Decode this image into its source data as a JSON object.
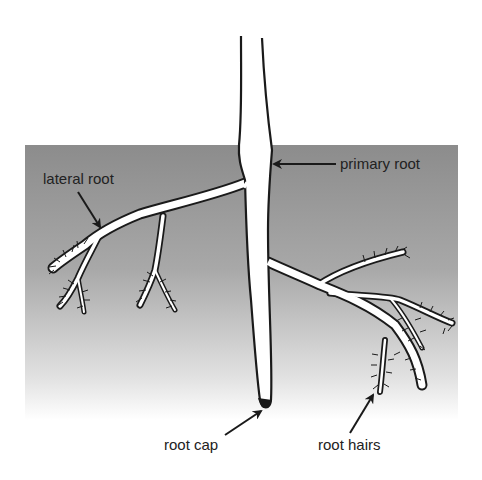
{
  "diagram": {
    "labels": {
      "primary_root": "primary root",
      "lateral_root": "lateral root",
      "root_cap": "root cap",
      "root_hairs": "root hairs"
    },
    "colors": {
      "soil_top": "#8c8c8c",
      "soil_bottom": "#ffffff",
      "root_fill": "#ffffff",
      "outline": "#1a1a1a",
      "text": "#222222"
    }
  }
}
